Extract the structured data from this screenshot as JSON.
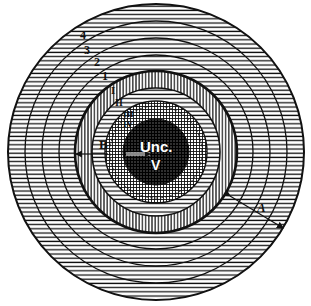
{
  "diagram": {
    "center": {
      "x": 156,
      "y": 152
    },
    "outer_radius": 148,
    "outer_rings": [
      {
        "label": "4",
        "radius": 148
      },
      {
        "label": "3",
        "radius": 131
      },
      {
        "label": "2",
        "radius": 114
      },
      {
        "label": "1",
        "radius": 97
      }
    ],
    "inner_bands": [
      {
        "label": "I",
        "radius": 81,
        "pattern": "vertical"
      },
      {
        "label": "II",
        "radius": 64,
        "pattern": "horizontal"
      },
      {
        "label": "III",
        "radius": 51,
        "pattern": "crosshatch"
      },
      {
        "label": "IV",
        "radius": 47,
        "pattern": "crosshatch"
      }
    ],
    "core": {
      "radius": 33,
      "label_top": "Unc.",
      "label_bottom": "V"
    },
    "dimension_labels": {
      "A": "A",
      "B": "B"
    },
    "colors": {
      "ink": "#111111",
      "paper": "#ffffff",
      "core": "#2a2a2a"
    }
  },
  "labels": {
    "ring4": "4",
    "ring3": "3",
    "ring2": "2",
    "ring1": "1",
    "bandI": "I",
    "bandII": "II",
    "bandIII": "III",
    "bandIV": "IV",
    "A": "A",
    "B": "B",
    "unc": "Unc.",
    "v": "V"
  }
}
